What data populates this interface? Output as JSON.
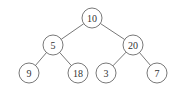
{
  "diagram": {
    "type": "binary-tree",
    "node_radius": 10,
    "nodes": [
      {
        "id": "n10",
        "label": "10",
        "x": 92,
        "y": 18
      },
      {
        "id": "n5",
        "label": "5",
        "x": 53,
        "y": 45
      },
      {
        "id": "n20",
        "label": "20",
        "x": 133,
        "y": 45
      },
      {
        "id": "n9",
        "label": "9",
        "x": 29,
        "y": 73
      },
      {
        "id": "n18",
        "label": "18",
        "x": 78,
        "y": 73
      },
      {
        "id": "n3",
        "label": "3",
        "x": 106,
        "y": 73
      },
      {
        "id": "n7",
        "label": "7",
        "x": 157,
        "y": 73
      }
    ],
    "edges": [
      {
        "from": "n10",
        "to": "n5"
      },
      {
        "from": "n10",
        "to": "n20"
      },
      {
        "from": "n5",
        "to": "n9"
      },
      {
        "from": "n5",
        "to": "n18"
      },
      {
        "from": "n20",
        "to": "n3"
      },
      {
        "from": "n20",
        "to": "n7"
      }
    ],
    "colors": {
      "stroke": "#555555",
      "text": "#333333",
      "background": "#ffffff"
    }
  }
}
